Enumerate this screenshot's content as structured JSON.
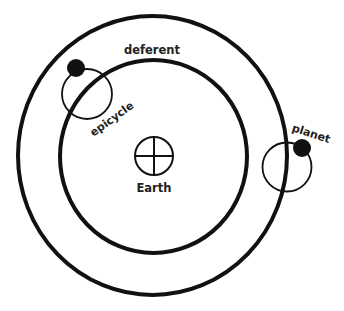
{
  "diagram": {
    "colors": {
      "stroke": "#111111",
      "background": "#ffffff",
      "text": "#222222"
    },
    "labels": {
      "deferent": "deferent",
      "epicycle": "epicycle",
      "planet": "planet",
      "earth": "Earth"
    },
    "elements": [
      {
        "id": "outer-orbit",
        "shape": "circle",
        "cx": 152.5,
        "cy": 155.5,
        "rx": 134.5,
        "ry": 139.5
      },
      {
        "id": "deferent",
        "shape": "circle",
        "cx": 153.5,
        "cy": 156.5,
        "rx": 93.5,
        "ry": 96.5
      },
      {
        "id": "epicycle-upper-left",
        "shape": "circle",
        "cx": 87,
        "cy": 94,
        "r": 25
      },
      {
        "id": "planet-upper-left",
        "shape": "dot",
        "cx": 76,
        "cy": 68,
        "r": 9
      },
      {
        "id": "epicycle-right",
        "shape": "circle",
        "cx": 287,
        "cy": 167,
        "r": 24.5
      },
      {
        "id": "planet-right",
        "shape": "dot",
        "cx": 302,
        "cy": 148,
        "r": 9
      },
      {
        "id": "earth-symbol",
        "shape": "circled-cross",
        "cx": 154,
        "cy": 156,
        "r": 19
      }
    ]
  }
}
